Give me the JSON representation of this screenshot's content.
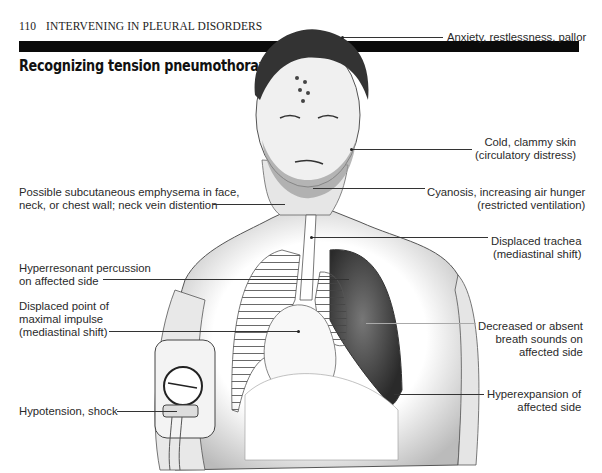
{
  "running_head": {
    "page_number": "110",
    "section": "INTERVENING IN PLEURAL DISORDERS"
  },
  "title": "Recognizing tension pneumothorax",
  "figure": {
    "callouts": {
      "anxiety": {
        "lines": [
          "Anxiety, restlessness, pallor"
        ],
        "side": "right"
      },
      "cold_skin": {
        "lines": [
          "Cold, clammy skin",
          "(circulatory distress)"
        ],
        "side": "right"
      },
      "emphysema": {
        "lines": [
          "Possible subcutaneous emphysema in face,",
          "neck, or chest wall; neck vein distention"
        ],
        "side": "left"
      },
      "cyanosis": {
        "lines": [
          "Cyanosis, increasing air hunger",
          "(restricted ventilation)"
        ],
        "side": "right"
      },
      "trachea": {
        "lines": [
          "Displaced trachea",
          "(mediastinal shift)"
        ],
        "side": "right"
      },
      "hyperresonant": {
        "lines": [
          "Hyperresonant percussion",
          "on affected side"
        ],
        "side": "left"
      },
      "pmi": {
        "lines": [
          "Displaced point of",
          "maximal impulse",
          "(mediastinal shift)"
        ],
        "side": "left"
      },
      "breath_sounds": {
        "lines": [
          "Decreased or absent",
          "breath sounds on",
          "affected side"
        ],
        "side": "right"
      },
      "hypotension": {
        "lines": [
          "Hypotension, shock"
        ],
        "side": "left"
      },
      "hyperexpansion": {
        "lines": [
          "Hyperexpansion of",
          "affected side"
        ],
        "side": "right"
      }
    }
  }
}
